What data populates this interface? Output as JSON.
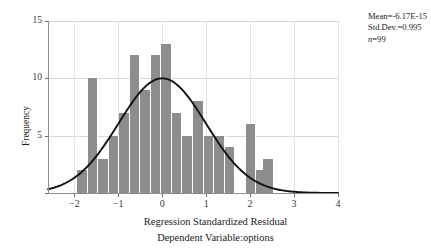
{
  "chart_data": {
    "type": "bar",
    "title": "",
    "subtitle": "",
    "xlabel": "Regression Standardized Residual",
    "xlabel2": "Dependent Variable:options",
    "ylabel": "Frequency",
    "xlim": [
      -2.6,
      4.0
    ],
    "ylim": [
      0,
      15
    ],
    "xticks": [
      -2,
      -1,
      0,
      1,
      2,
      3,
      4
    ],
    "xtick_labels": [
      "−2",
      "−1",
      "0",
      "1",
      "2",
      "3",
      "4"
    ],
    "yticks": [
      0,
      5,
      10,
      15
    ],
    "ytick_labels": [
      "",
      "5",
      "10",
      "15"
    ],
    "grid": true,
    "legend": "none",
    "bar_color": "#8d8d8d",
    "curve_color": "#111111",
    "bin_width": 0.24,
    "bin_centers": [
      -1.82,
      -1.58,
      -1.34,
      -1.1,
      -0.86,
      -0.62,
      -0.38,
      -0.14,
      0.1,
      0.34,
      0.58,
      0.82,
      1.06,
      1.3,
      1.54,
      1.78,
      2.02,
      2.26,
      2.42
    ],
    "values": [
      2,
      10,
      3,
      5,
      7,
      12,
      9,
      12,
      13,
      7,
      5,
      8,
      5,
      5,
      4,
      0,
      6,
      2,
      3
    ],
    "overlay": {
      "type": "normal-curve",
      "mean": 0,
      "std": 0.995,
      "peak_frequency": 10
    }
  },
  "stats": {
    "mean_label": "Mean=-6.17E-15",
    "sd_label": "Std.Dev.=0.995",
    "n_prefix": "n",
    "n_label": "=99"
  }
}
